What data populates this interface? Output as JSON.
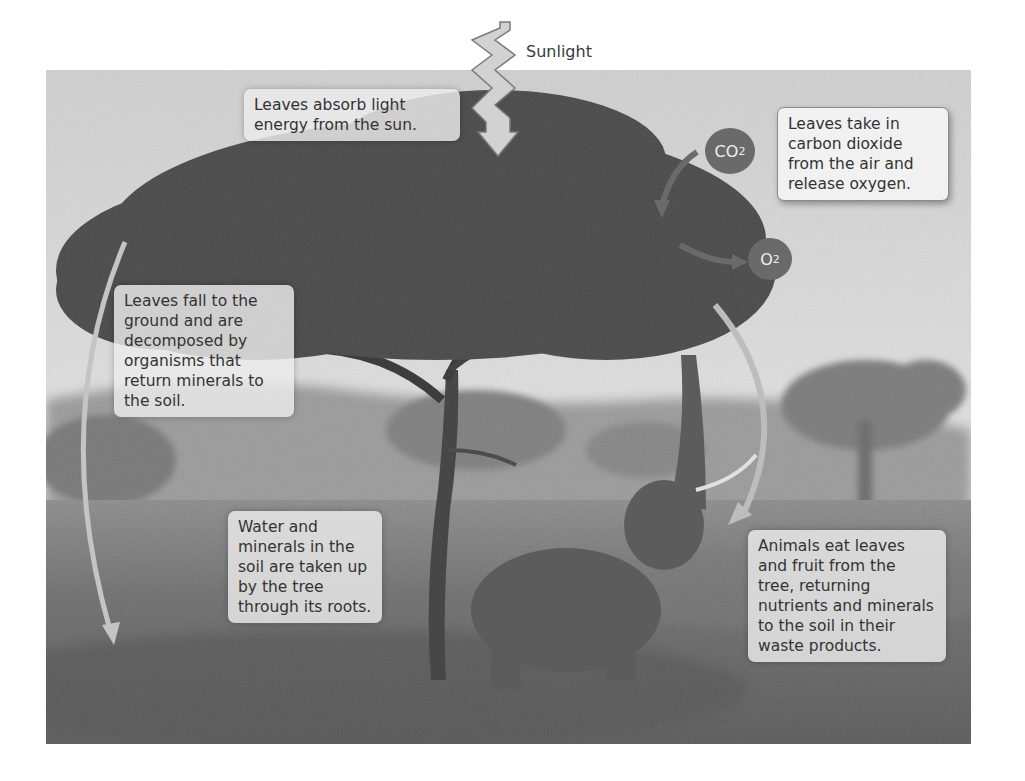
{
  "diagram": {
    "title_sun": "Sunlight",
    "molecules": {
      "co2": {
        "base": "CO",
        "sub": "2"
      },
      "o2": {
        "base": "O",
        "sub": "2"
      }
    },
    "labels": {
      "absorb_light": "Leaves absorb light energy from the sun.",
      "gas_exchange": "Leaves take in carbon dioxide from the air and release oxygen.",
      "decompose": "Leaves fall to the ground and are decomposed by organisms that return minerals to the soil.",
      "roots": "Water and minerals in the soil are taken up by the tree through its roots.",
      "animals": "Animals eat leaves and fruit from the tree, returning nutrients and minerals to the soil in their waste products."
    },
    "photo_description": "Acacia tree on savanna with an elephant reaching its trunk up into the branches",
    "colors": {
      "sky": "#d9d9d9",
      "foliage": "#3f3f3f",
      "grass": "#6b6b6b",
      "bubble": "#6a6a6a",
      "arrow": "#bfbfbf"
    }
  }
}
